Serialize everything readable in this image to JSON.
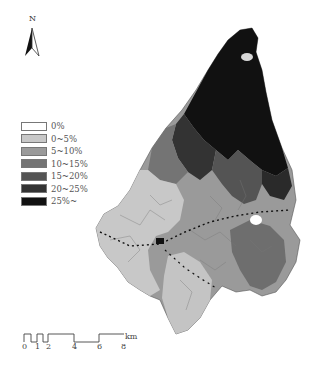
{
  "north_arrow": {
    "label": "N",
    "icon": "north-arrow-icon"
  },
  "legend": {
    "items": [
      {
        "label": "0%",
        "color": "#ffffff"
      },
      {
        "label": "0~5%",
        "color": "#c8c8c8"
      },
      {
        "label": "5~10%",
        "color": "#9a9a9a"
      },
      {
        "label": "10~15%",
        "color": "#747474"
      },
      {
        "label": "15~20%",
        "color": "#545454"
      },
      {
        "label": "20~25%",
        "color": "#333333"
      },
      {
        "label": "25%~",
        "color": "#111111"
      }
    ]
  },
  "scale_bar": {
    "ticks": [
      "0",
      "1",
      "2",
      "4",
      "6",
      "8"
    ],
    "unit": "km"
  },
  "map": {
    "title": "",
    "description": "Choropleth map of sub-regions shaded by percentage class; darkest (25%~) in the north, lighter (0~5%) in the southwest, dotted route line crossing the centre"
  }
}
